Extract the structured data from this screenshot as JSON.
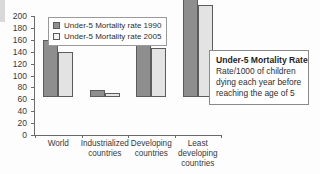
{
  "chart_data": {
    "type": "bar",
    "title": "",
    "xlabel": "",
    "ylabel": "",
    "ylim": [
      0,
      200
    ],
    "yticks": [
      0,
      20,
      40,
      60,
      80,
      100,
      120,
      140,
      160,
      180,
      200
    ],
    "grid": false,
    "legend_position": "top-left-inside",
    "categories": [
      "World",
      "Industrialized countries",
      "Developing countries",
      "Least developing countries"
    ],
    "series": [
      {
        "name": "Under-5 Mortality rate 1990",
        "color": "#8e8e8e",
        "values": [
          96,
          11,
          106,
          182
        ]
      },
      {
        "name": "Under-5 Mortality rate 2005",
        "color": "#e3e3e3",
        "values": [
          76,
          7,
          83,
          155
        ]
      }
    ]
  },
  "legend": {
    "items": [
      {
        "label": "Under-5 Mortality rate 1990"
      },
      {
        "label": "Under-5 Mortality rate 2005"
      }
    ]
  },
  "annotation": {
    "title": "Under-5 Mortality Rate",
    "lines": [
      "Rate/1000 of children",
      "dying each year before",
      "reaching the age of 5"
    ]
  }
}
